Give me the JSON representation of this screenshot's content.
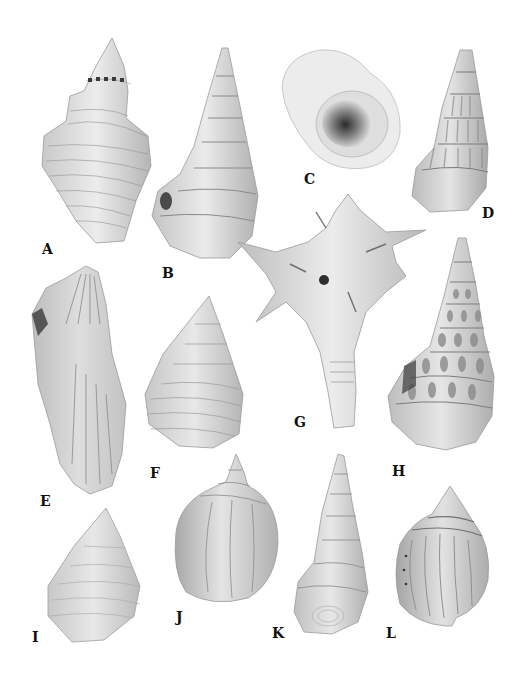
{
  "figure": {
    "type": "specimen plate",
    "panels": [
      {
        "label": "A",
        "description": "fusiform shell with shouldered whorls and spiral ribs"
      },
      {
        "label": "B",
        "description": "tall turreted spire shell with strong spiral cords"
      },
      {
        "label": "C",
        "description": "smooth globular shell, apertural view"
      },
      {
        "label": "D",
        "description": "slender turreted shell with axial ribs"
      },
      {
        "label": "E",
        "description": "elongate rough bivalve (oyster-like) valve"
      },
      {
        "label": "F",
        "description": "conical shell with fine spiral lines"
      },
      {
        "label": "G",
        "description": "spiny muricid shell with long siphonal canal"
      },
      {
        "label": "H",
        "description": "high-spired shell with nodulose whorls"
      },
      {
        "label": "I",
        "description": "conical shell with fine spiral sculpture"
      },
      {
        "label": "J",
        "description": "inflated globose shell with short spire"
      },
      {
        "label": "K",
        "description": "tall slender shell with smooth whorls"
      },
      {
        "label": "L",
        "description": "globose shell with axial ribs and dark spiral bands"
      }
    ]
  },
  "colors": {
    "background": "#ffffff",
    "shell_light": "#e6e6e6",
    "shell_mid": "#bdbdbd",
    "shell_dark": "#6e6e6e",
    "label": "#111111"
  }
}
